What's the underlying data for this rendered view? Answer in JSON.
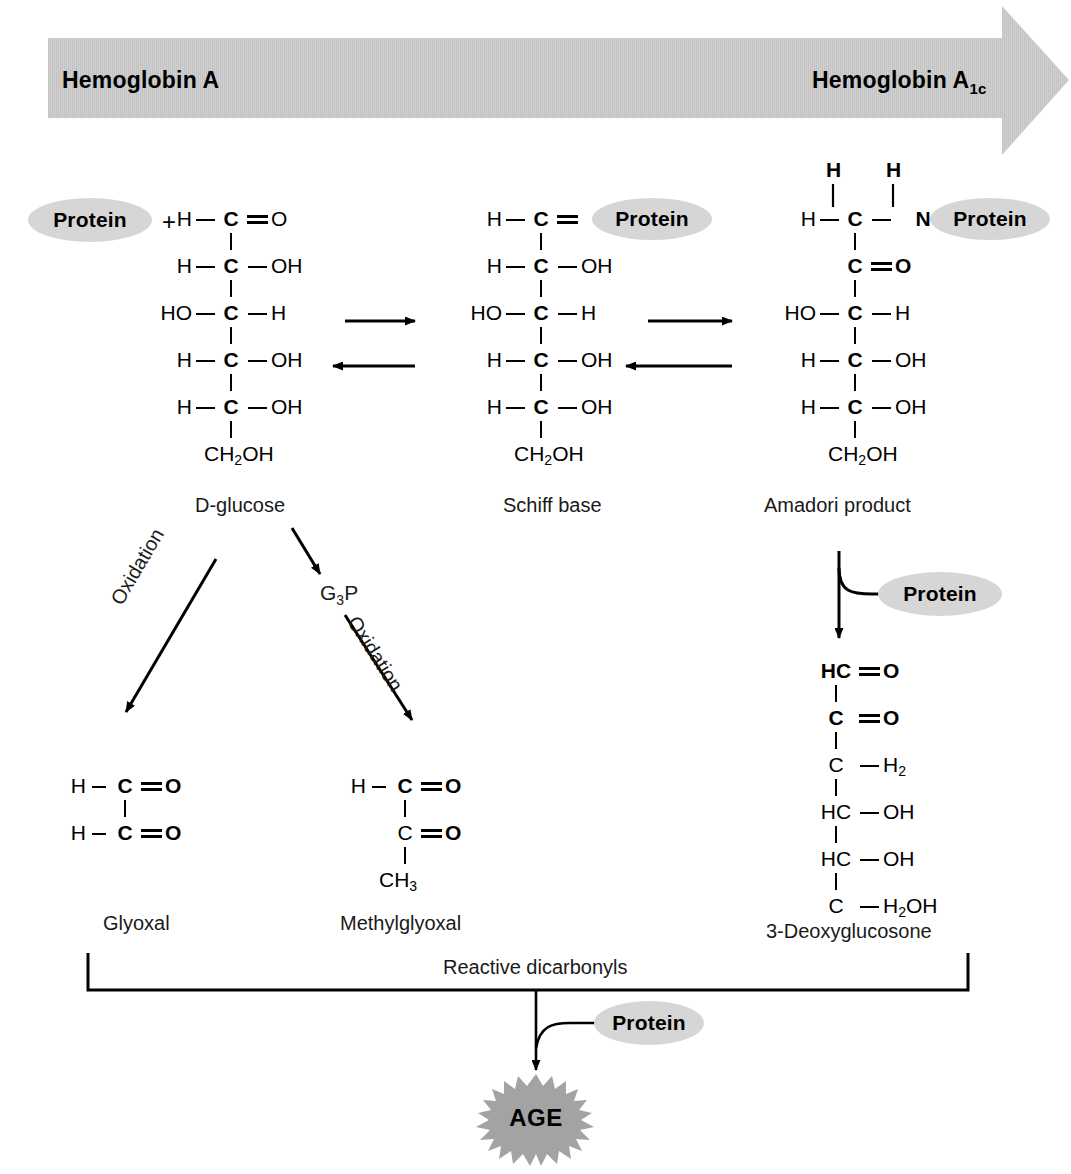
{
  "figure": {
    "background_color": "#ffffff",
    "ink_color": "#000000"
  },
  "banner": {
    "name": "hemoglobin-conversion-arrow",
    "fill_color": "#cccccc",
    "left_label": "Hemoglobin A",
    "right_label_base": "Hemoglobin A",
    "right_label_sub": "1c"
  },
  "labels": {
    "plus": "+",
    "protein": "Protein",
    "g3p_base": "G",
    "g3p_sub": "3",
    "g3p_tail": "P",
    "oxidation": "Oxidation",
    "reactive_dicarbonyls": "Reactive dicarbonyls",
    "age": "AGE",
    "age_fill_color": "#a3a3a3",
    "protein_fill_color": "#d6d6d6"
  },
  "captions": {
    "d_glucose": "D-glucose",
    "schiff_base": "Schiff base",
    "amadori_product": "Amadori product",
    "glyoxal": "Glyoxal",
    "methylglyoxal": "Methylglyoxal",
    "deoxyglucosone": "3-Deoxyglucosone"
  },
  "molecules": {
    "d_glucose": {
      "name": "D-glucose",
      "rows": [
        {
          "left": "H",
          "bond_left": "single",
          "core": "C",
          "bond_right": "double",
          "right": "O"
        },
        {
          "left": "H",
          "bond_left": "single",
          "core": "C",
          "bond_right": "single",
          "right": "OH"
        },
        {
          "left": "HO",
          "bond_left": "single",
          "core": "C",
          "bond_right": "single",
          "right": "H"
        },
        {
          "left": "H",
          "bond_left": "single",
          "core": "C",
          "bond_right": "single",
          "right": "OH"
        },
        {
          "left": "H",
          "bond_left": "single",
          "core": "C",
          "bond_right": "single",
          "right": "OH"
        },
        {
          "left": "",
          "bond_left": "none",
          "core": "CH2OH",
          "bond_right": "none",
          "right": ""
        }
      ]
    },
    "schiff_base": {
      "name": "Schiff base",
      "rows": [
        {
          "left": "H",
          "bond_left": "single",
          "core": "C",
          "bond_right": "double",
          "right": "N"
        },
        {
          "left": "H",
          "bond_left": "single",
          "core": "C",
          "bond_right": "single",
          "right": "OH"
        },
        {
          "left": "HO",
          "bond_left": "single",
          "core": "C",
          "bond_right": "single",
          "right": "H"
        },
        {
          "left": "H",
          "bond_left": "single",
          "core": "C",
          "bond_right": "single",
          "right": "OH"
        },
        {
          "left": "H",
          "bond_left": "single",
          "core": "C",
          "bond_right": "single",
          "right": "OH"
        },
        {
          "left": "",
          "bond_left": "none",
          "core": "CH2OH",
          "bond_right": "none",
          "right": ""
        }
      ]
    },
    "amadori_product": {
      "name": "Amadori product",
      "top_hydrogens": [
        "H",
        "H"
      ],
      "rows": [
        {
          "left": "H",
          "bond_left": "single",
          "core": "C",
          "bond_right": "single",
          "right": "N"
        },
        {
          "left": "",
          "bond_left": "none",
          "core": "C",
          "bond_right": "double",
          "right": "O"
        },
        {
          "left": "HO",
          "bond_left": "single",
          "core": "C",
          "bond_right": "single",
          "right": "H"
        },
        {
          "left": "H",
          "bond_left": "single",
          "core": "C",
          "bond_right": "single",
          "right": "OH"
        },
        {
          "left": "H",
          "bond_left": "single",
          "core": "C",
          "bond_right": "single",
          "right": "OH"
        },
        {
          "left": "",
          "bond_left": "none",
          "core": "CH2OH",
          "bond_right": "none",
          "right": ""
        }
      ]
    },
    "glyoxal": {
      "name": "Glyoxal",
      "rows": [
        {
          "left": "H",
          "bond_left": "single",
          "core": "C",
          "bond_right": "double",
          "right": "O"
        },
        {
          "left": "H",
          "bond_left": "single",
          "core": "C",
          "bond_right": "double",
          "right": "O"
        }
      ]
    },
    "methylglyoxal": {
      "name": "Methylglyoxal",
      "rows": [
        {
          "left": "H",
          "bond_left": "single",
          "core": "C",
          "bond_right": "double",
          "right": "O"
        },
        {
          "left": "",
          "bond_left": "none",
          "core": "C",
          "bond_right": "double",
          "right": "O"
        },
        {
          "left": "",
          "bond_left": "none",
          "core": "CH3",
          "bond_right": "none",
          "right": ""
        }
      ]
    },
    "deoxyglucosone": {
      "name": "3-Deoxyglucosone",
      "rows": [
        {
          "left": "",
          "bond_left": "none",
          "core": "HC",
          "bond_right": "double",
          "right": "O"
        },
        {
          "left": "",
          "bond_left": "none",
          "core": "C",
          "bond_right": "double",
          "right": "O"
        },
        {
          "left": "",
          "bond_left": "none",
          "core": "C",
          "bond_right": "single",
          "right": "H2"
        },
        {
          "left": "",
          "bond_left": "none",
          "core": "HC",
          "bond_right": "single",
          "right": "OH"
        },
        {
          "left": "",
          "bond_left": "none",
          "core": "HC",
          "bond_right": "single",
          "right": "OH"
        },
        {
          "left": "",
          "bond_left": "none",
          "core": "C",
          "bond_right": "single",
          "right": "H2OH"
        }
      ]
    }
  },
  "reaction_arrows": [
    {
      "name": "glucose-to-schiff-forward",
      "direction": "right"
    },
    {
      "name": "schiff-to-glucose-reverse",
      "direction": "left"
    },
    {
      "name": "schiff-to-amadori-forward",
      "direction": "right"
    },
    {
      "name": "amadori-to-schiff-reverse",
      "direction": "left"
    },
    {
      "name": "glucose-oxidation-to-glyoxal",
      "direction": "down-left",
      "label": "Oxidation"
    },
    {
      "name": "glucose-to-g3p",
      "direction": "down-right",
      "label": ""
    },
    {
      "name": "g3p-oxidation-to-methylglyoxal",
      "direction": "down-right",
      "label": "Oxidation"
    },
    {
      "name": "amadori-to-deoxyglucosone",
      "direction": "down",
      "label": ""
    },
    {
      "name": "amadori-releases-protein",
      "direction": "right",
      "label": "Protein"
    },
    {
      "name": "dicarbonyls-to-age",
      "direction": "down",
      "label": "Protein"
    }
  ]
}
